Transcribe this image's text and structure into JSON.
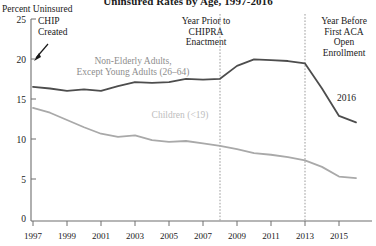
{
  "chart_data": {
    "type": "line",
    "title": "Uninsured Rates by Age, 1997-2016",
    "ylabel": "Percent Uninsured",
    "xlabel": "",
    "ylim": [
      0,
      25
    ],
    "yticks": [
      0,
      5,
      10,
      15,
      20,
      25
    ],
    "xlim": [
      1997,
      2016
    ],
    "xticks": [
      1997,
      1999,
      2001,
      2003,
      2005,
      2007,
      2009,
      2011,
      2013,
      2015
    ],
    "xtick_labels": [
      "1997",
      "1999",
      "2001",
      "2003",
      "2005",
      "2007",
      "2009",
      "2011",
      "2013",
      "2015"
    ],
    "grid": false,
    "legend_position": "inline-labels",
    "x": [
      1997,
      1998,
      1999,
      2000,
      2001,
      2002,
      2003,
      2004,
      2005,
      2006,
      2007,
      2008,
      2009,
      2010,
      2011,
      2012,
      2013,
      2014,
      2015,
      2016
    ],
    "series": [
      {
        "name": "Non-Elderly Adults, Except Young Adults (26-64)",
        "color": "#4d4d4d",
        "values": [
          16.6,
          16.4,
          16.1,
          16.3,
          16.1,
          16.7,
          17.2,
          17.1,
          17.2,
          17.6,
          17.5,
          17.6,
          19.2,
          20.0,
          19.9,
          19.8,
          19.5,
          16.4,
          13.0,
          12.2
        ]
      },
      {
        "name": "Children (<19)",
        "color": "#a9a9a9",
        "values": [
          14.0,
          13.4,
          12.5,
          11.6,
          10.8,
          10.4,
          10.6,
          10.0,
          9.8,
          9.9,
          9.6,
          9.3,
          8.9,
          8.4,
          8.2,
          7.9,
          7.5,
          6.7,
          5.5,
          5.3
        ]
      }
    ],
    "reference_lines": [
      {
        "name": "chipra-reference-line",
        "x": 2008,
        "style": "dashed"
      },
      {
        "name": "aca-reference-line",
        "x": 2013,
        "style": "dashed"
      }
    ],
    "annotations": [
      {
        "id": "chip-created",
        "text_lines": [
          "CHIP",
          "Created"
        ],
        "arrow": true
      },
      {
        "id": "chipra-enactment",
        "text_lines": [
          "Year Prior to",
          "CHIPRA",
          "Enactment"
        ],
        "arrow": false
      },
      {
        "id": "aca-open-enrollment",
        "text_lines": [
          "Year Before",
          "First ACA",
          "Open",
          "Enrollment"
        ],
        "arrow": false
      },
      {
        "id": "endpoint-2016",
        "text_lines": [
          "2016"
        ],
        "arrow": false
      }
    ]
  },
  "labels": {
    "title": "Uninsured Rates by Age, 1997-2016",
    "y_axis_title": "Percent Uninsured",
    "ytick_25": "25",
    "ytick_20": "20",
    "ytick_15": "15",
    "ytick_10": "10",
    "ytick_5": "5",
    "ytick_0": "0",
    "xtick_1997": "1997",
    "xtick_1999": "1999",
    "xtick_2001": "2001",
    "xtick_2003": "2003",
    "xtick_2005": "2005",
    "xtick_2007": "2007",
    "xtick_2009": "2009",
    "xtick_2011": "2011",
    "xtick_2013": "2013",
    "xtick_2015": "2015",
    "anno_chip_line1": "CHIP",
    "anno_chip_line2": "Created",
    "anno_chipra_line1": "Year Prior to",
    "anno_chipra_line2": "CHIPRA",
    "anno_chipra_line3": "Enactment",
    "anno_aca_line1": "Year Before",
    "anno_aca_line2": "First ACA",
    "anno_aca_line3": "Open",
    "anno_aca_line4": "Enrollment",
    "series_adults_line1": "Non-Elderly Adults,",
    "series_adults_line2": "Except Young Adults (26–64)",
    "series_children": "Children (<19)",
    "endpoint_2016": "2016"
  },
  "colors": {
    "adults_line": "#4d4d4d",
    "children_line": "#a9a9a9",
    "axis": "#6e6e6e",
    "reference_line": "#9b9b9b",
    "text": "#1a1a1a"
  }
}
